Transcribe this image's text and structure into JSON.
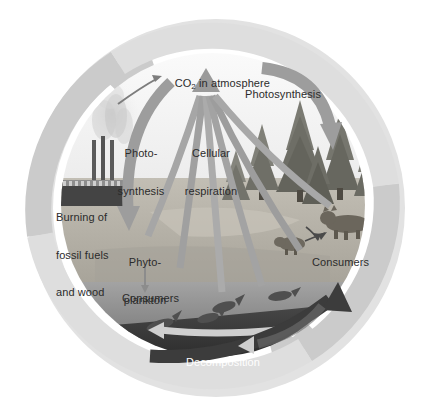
{
  "figure": {
    "type": "carbon-cycle-diagram",
    "canvas": {
      "width": 427,
      "height": 410,
      "background": "#ffffff"
    }
  },
  "colors": {
    "outer_ring": "#c9c9c9",
    "outer_ring_shadow": "#d9d9d9",
    "arrow_gray": "#9a9a9a",
    "arrow_gray_light": "#aeaeae",
    "arrow_dark": "#3a3a3a",
    "sky": "#efefef",
    "land": "#b4b0a6",
    "water": "#9a9a9a",
    "deep_water": "#2f2f2f",
    "tree_green": "#6b6b63",
    "factory": "#4a4a4a",
    "text": "#2b2b2b",
    "text_light": "#ffffff"
  },
  "labels": {
    "co2_atmosphere": {
      "prefix": "CO",
      "sub": "2",
      "suffix": " in atmosphere"
    },
    "photosynthesis_right": "Photosynthesis",
    "photosynthesis_left_line1": "Photo-",
    "photosynthesis_left_line2": "synthesis",
    "cellular_respiration_line1": "Cellular",
    "cellular_respiration_line2": "respiration",
    "burning_line1": "Burning of",
    "burning_line2": "fossil fuels",
    "burning_line3": "and wood",
    "phytoplankton_line1": "Phyto-",
    "phytoplankton_line2": "plankton",
    "consumers_water": "Consumers",
    "consumers_land": "Consumers",
    "decomposition": "Decomposition"
  },
  "scene_elements": {
    "factory": {
      "name": "factory-with-smokestacks",
      "stacks": 3,
      "smoke": true
    },
    "trees": {
      "name": "conifer-forest",
      "count": 6
    },
    "land_animals": {
      "large": "bear",
      "small": "small-mammal"
    },
    "water_animals": {
      "name": "fish",
      "count": 4
    }
  },
  "flows": [
    {
      "id": "burning-to-co2",
      "from": "Burning of fossil fuels and wood",
      "to": "CO2 in atmosphere",
      "style": "thin-arrow"
    },
    {
      "id": "photosynthesis-ocean",
      "from": "CO2 in atmosphere",
      "to": "Phytoplankton",
      "style": "thick-gray-arrow"
    },
    {
      "id": "photosynthesis-land",
      "from": "CO2 in atmosphere",
      "to": "Forest",
      "style": "thick-gray-arrow"
    },
    {
      "id": "cellular-respiration",
      "from": "Organisms",
      "to": "CO2 in atmosphere",
      "style": "converging-gray-arrows"
    },
    {
      "id": "phytoplankton-to-consumers",
      "from": "Phytoplankton",
      "to": "Consumers",
      "style": "thin-arrow"
    },
    {
      "id": "small-mammal-to-bear",
      "from": "small-mammal",
      "to": "bear",
      "style": "thin-arrow"
    },
    {
      "id": "decomposition",
      "from": "Dead matter",
      "to": "Soil and sediment",
      "style": "dark-curved-arrow"
    },
    {
      "id": "outer-cycle",
      "from": "cycle",
      "to": "cycle",
      "style": "large-ring-arrows"
    }
  ]
}
